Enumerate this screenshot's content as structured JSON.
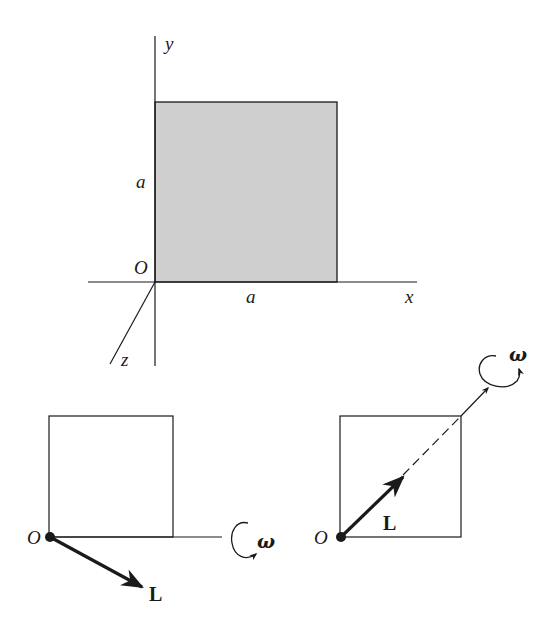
{
  "colors": {
    "ink": "#1a1a1a",
    "plate_fill": "#cfcfcf",
    "background": "#ffffff"
  },
  "top_figure": {
    "axes": {
      "x_label": "x",
      "y_label": "y",
      "z_label": "z",
      "origin_label": "O"
    },
    "plate": {
      "side_label_vertical": "a",
      "side_label_horizontal": "a",
      "shaded": true
    }
  },
  "bottom_left_figure": {
    "origin_label": "O",
    "angular_momentum_label": "L",
    "angular_velocity_label": "ω",
    "rotation_axis": "horizontal, along bottom edge"
  },
  "bottom_right_figure": {
    "origin_label": "O",
    "angular_momentum_label": "L",
    "angular_velocity_label": "ω",
    "rotation_axis": "diagonal through opposite corner"
  }
}
